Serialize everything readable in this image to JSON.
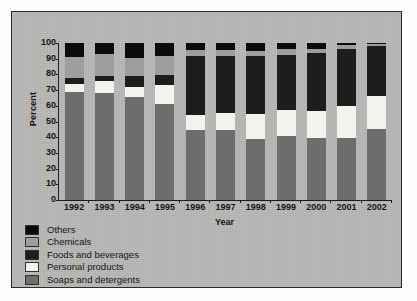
{
  "chart_data": {
    "type": "bar",
    "subtype": "stacked-bar-100-percent",
    "title": "",
    "xlabel": "Year",
    "ylabel": "Percent",
    "ylim": [
      0,
      100
    ],
    "yticks": [
      0,
      10,
      20,
      30,
      40,
      50,
      60,
      70,
      80,
      90,
      100
    ],
    "grid": false,
    "legend_position": "below-axes-left",
    "categories": [
      "1992",
      "1993",
      "1994",
      "1995",
      "1996",
      "1997",
      "1998",
      "1999",
      "2000",
      "2001",
      "2002"
    ],
    "series": [
      {
        "name": "Soaps and detergents",
        "color": "#6d6d6b",
        "values": [
          69,
          68,
          65.5,
          61,
          44.5,
          44.5,
          39,
          41,
          39.5,
          39.5,
          45
        ]
      },
      {
        "name": "Personal products",
        "color": "#f2f2ef",
        "values": [
          5,
          8,
          6.5,
          12,
          9.5,
          11,
          15.5,
          16.5,
          17,
          20.5,
          21
        ]
      },
      {
        "name": "Foods and beverages",
        "color": "#1d1d1d",
        "values": [
          4,
          3,
          7,
          6.5,
          38,
          36.5,
          37.5,
          35,
          37,
          36,
          32
        ]
      },
      {
        "name": "Chemicals",
        "color": "#9e9e9c",
        "values": [
          13,
          14,
          11.5,
          12,
          3.5,
          3.5,
          3,
          3.5,
          2.5,
          2.5,
          1.5
        ]
      },
      {
        "name": "Others",
        "color": "#0b0b0b",
        "values": [
          9,
          7,
          9.5,
          8.5,
          4.5,
          4.5,
          5,
          4,
          4,
          1.5,
          0.5
        ]
      }
    ]
  },
  "axes": {
    "y_title": "Percent",
    "x_title": "Year",
    "y_tick_labels": [
      "100",
      "90",
      "80",
      "70",
      "60",
      "50",
      "40",
      "30",
      "20",
      "10",
      "0"
    ],
    "x_tick_labels": [
      "1992",
      "1993",
      "1994",
      "1995",
      "1996",
      "1997",
      "1998",
      "1999",
      "2000",
      "2001",
      "2002"
    ]
  },
  "legend": {
    "items": [
      {
        "label": "Others",
        "color": "#0b0b0b"
      },
      {
        "label": "Chemicals",
        "color": "#9e9e9c"
      },
      {
        "label": "Foods and beverages",
        "color": "#1d1d1d"
      },
      {
        "label": "Personal products",
        "color": "#f2f2ef"
      },
      {
        "label": "Soaps and detergents",
        "color": "#6d6d6b"
      }
    ]
  },
  "colors": {
    "panel_background": "#b9b9b7",
    "page_background": "#fdfdfd",
    "axis": "#1c1c1c",
    "text": "#141414"
  }
}
